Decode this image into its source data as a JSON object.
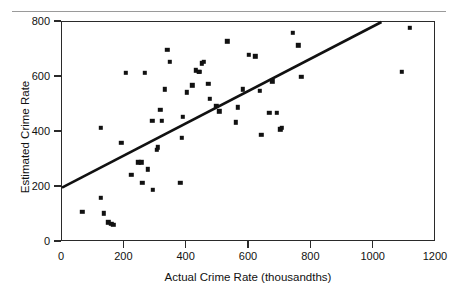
{
  "figure": {
    "top_caption": "",
    "ylabel": "Estimated Crime Rate",
    "xlabel": "Actual Crime Rate (thousandths)",
    "marker_color": "#111111",
    "line_color": "#111111",
    "frame_color": "#2a2a2a"
  },
  "chart_data": {
    "type": "scatter",
    "title": "",
    "xlabel": "Actual Crime Rate (thousandths)",
    "ylabel": "Estimated Crime Rate",
    "xlim": [
      0,
      1200
    ],
    "ylim": [
      0,
      800
    ],
    "xticks": [
      0,
      200,
      400,
      600,
      800,
      1000,
      1200
    ],
    "yticks": [
      0,
      200,
      400,
      600,
      800
    ],
    "xtick_labels": [
      "0",
      "200",
      "400",
      "600",
      "800",
      "1000",
      "1200"
    ],
    "ytick_labels": [
      "0",
      "200",
      "400",
      "600",
      "800"
    ],
    "grid": false,
    "legend": null,
    "series": [
      {
        "name": "observations",
        "marker": "square",
        "points": [
          [
            65,
            110
          ],
          [
            125,
            160
          ],
          [
            135,
            105
          ],
          [
            148,
            72
          ],
          [
            158,
            66
          ],
          [
            165,
            62
          ],
          [
            125,
            415
          ],
          [
            190,
            360
          ],
          [
            205,
            615
          ],
          [
            222,
            245
          ],
          [
            245,
            290
          ],
          [
            255,
            290
          ],
          [
            258,
            215
          ],
          [
            265,
            615
          ],
          [
            275,
            265
          ],
          [
            290,
            440
          ],
          [
            292,
            190
          ],
          [
            305,
            335
          ],
          [
            308,
            345
          ],
          [
            315,
            480
          ],
          [
            320,
            440
          ],
          [
            330,
            555
          ],
          [
            338,
            700
          ],
          [
            345,
            655
          ],
          [
            380,
            215
          ],
          [
            385,
            380
          ],
          [
            388,
            455
          ],
          [
            400,
            545
          ],
          [
            418,
            570
          ],
          [
            430,
            625
          ],
          [
            438,
            620
          ],
          [
            440,
            620
          ],
          [
            448,
            650
          ],
          [
            455,
            655
          ],
          [
            470,
            575
          ],
          [
            475,
            520
          ],
          [
            495,
            495
          ],
          [
            505,
            475
          ],
          [
            530,
            730
          ],
          [
            558,
            435
          ],
          [
            565,
            490
          ],
          [
            580,
            555
          ],
          [
            600,
            680
          ],
          [
            620,
            675
          ],
          [
            635,
            550
          ],
          [
            640,
            390
          ],
          [
            665,
            470
          ],
          [
            675,
            585
          ],
          [
            690,
            470
          ],
          [
            700,
            410
          ],
          [
            705,
            415
          ],
          [
            740,
            760
          ],
          [
            758,
            715
          ],
          [
            768,
            600
          ],
          [
            1090,
            620
          ],
          [
            1115,
            780
          ]
        ]
      }
    ],
    "fit_line": {
      "name": "regression-line",
      "x0": 0,
      "y0": 198,
      "x1": 1025,
      "y1": 800
    }
  }
}
